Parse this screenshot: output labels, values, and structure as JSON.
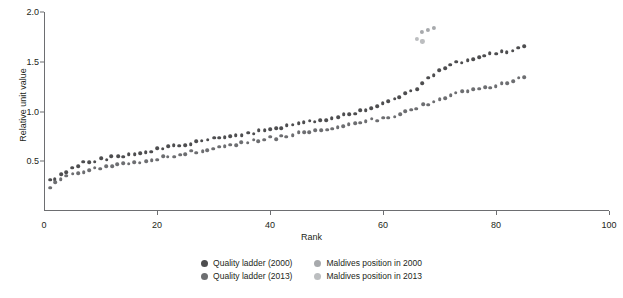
{
  "chart_data": {
    "type": "scatter",
    "title": "",
    "xlabel": "Rank",
    "ylabel": "Relative unit value",
    "xlim": [
      0,
      100
    ],
    "ylim": [
      0.0,
      2.0
    ],
    "xticks": [
      0,
      20,
      40,
      60,
      80,
      100
    ],
    "yticks": [
      0.5,
      1.0,
      1.5,
      2.0
    ],
    "ytick_labels": [
      "0.5",
      "1.0",
      "1.5",
      "2.0"
    ],
    "xtick_labels": [
      "0",
      "20",
      "40",
      "60",
      "80",
      "100"
    ],
    "grid": false,
    "legend_position": "bottom-center",
    "series": [
      {
        "name": "Quality ladder (2000)",
        "color": "#4d4d4f",
        "points": [
          [
            1,
            0.3
          ],
          [
            2,
            0.33
          ],
          [
            3,
            0.37
          ],
          [
            4,
            0.4
          ],
          [
            5,
            0.43
          ],
          [
            6,
            0.46
          ],
          [
            7,
            0.48
          ],
          [
            8,
            0.5
          ],
          [
            9,
            0.51
          ],
          [
            10,
            0.52
          ],
          [
            11,
            0.53
          ],
          [
            12,
            0.54
          ],
          [
            13,
            0.55
          ],
          [
            14,
            0.56
          ],
          [
            15,
            0.57
          ],
          [
            16,
            0.58
          ],
          [
            17,
            0.59
          ],
          [
            18,
            0.6
          ],
          [
            19,
            0.61
          ],
          [
            20,
            0.62
          ],
          [
            21,
            0.63
          ],
          [
            22,
            0.64
          ],
          [
            23,
            0.65
          ],
          [
            24,
            0.66
          ],
          [
            25,
            0.67
          ],
          [
            26,
            0.68
          ],
          [
            27,
            0.69
          ],
          [
            28,
            0.7
          ],
          [
            29,
            0.71
          ],
          [
            30,
            0.72
          ],
          [
            31,
            0.73
          ],
          [
            32,
            0.74
          ],
          [
            33,
            0.75
          ],
          [
            34,
            0.76
          ],
          [
            35,
            0.77
          ],
          [
            36,
            0.78
          ],
          [
            37,
            0.79
          ],
          [
            38,
            0.8
          ],
          [
            39,
            0.81
          ],
          [
            40,
            0.82
          ],
          [
            41,
            0.83
          ],
          [
            42,
            0.84
          ],
          [
            43,
            0.85
          ],
          [
            44,
            0.86
          ],
          [
            45,
            0.87
          ],
          [
            46,
            0.88
          ],
          [
            47,
            0.89
          ],
          [
            48,
            0.9
          ],
          [
            49,
            0.91
          ],
          [
            50,
            0.92
          ],
          [
            51,
            0.94
          ],
          [
            52,
            0.95
          ],
          [
            53,
            0.96
          ],
          [
            54,
            0.98
          ],
          [
            55,
            0.99
          ],
          [
            56,
            1.0
          ],
          [
            57,
            1.02
          ],
          [
            58,
            1.04
          ],
          [
            59,
            1.06
          ],
          [
            60,
            1.08
          ],
          [
            61,
            1.1
          ],
          [
            62,
            1.12
          ],
          [
            63,
            1.15
          ],
          [
            64,
            1.17
          ],
          [
            65,
            1.2
          ],
          [
            66,
            1.24
          ],
          [
            67,
            1.28
          ],
          [
            68,
            1.33
          ],
          [
            69,
            1.38
          ],
          [
            70,
            1.42
          ],
          [
            71,
            1.45
          ],
          [
            72,
            1.47
          ],
          [
            73,
            1.49
          ],
          [
            74,
            1.5
          ],
          [
            75,
            1.51
          ],
          [
            76,
            1.52
          ],
          [
            77,
            1.53
          ],
          [
            78,
            1.55
          ],
          [
            79,
            1.57
          ],
          [
            80,
            1.58
          ],
          [
            81,
            1.59
          ],
          [
            82,
            1.6
          ],
          [
            83,
            1.62
          ],
          [
            84,
            1.64
          ],
          [
            85,
            1.67
          ]
        ]
      },
      {
        "name": "Quality ladder (2013)",
        "color": "#6d6e71",
        "points": [
          [
            1,
            0.25
          ],
          [
            2,
            0.28
          ],
          [
            3,
            0.31
          ],
          [
            4,
            0.34
          ],
          [
            5,
            0.36
          ],
          [
            6,
            0.38
          ],
          [
            7,
            0.4
          ],
          [
            8,
            0.41
          ],
          [
            9,
            0.42
          ],
          [
            10,
            0.43
          ],
          [
            11,
            0.44
          ],
          [
            12,
            0.45
          ],
          [
            13,
            0.46
          ],
          [
            14,
            0.47
          ],
          [
            15,
            0.48
          ],
          [
            16,
            0.49
          ],
          [
            17,
            0.5
          ],
          [
            18,
            0.51
          ],
          [
            19,
            0.52
          ],
          [
            20,
            0.53
          ],
          [
            21,
            0.54
          ],
          [
            22,
            0.55
          ],
          [
            23,
            0.56
          ],
          [
            24,
            0.57
          ],
          [
            25,
            0.58
          ],
          [
            26,
            0.59
          ],
          [
            27,
            0.6
          ],
          [
            28,
            0.61
          ],
          [
            29,
            0.62
          ],
          [
            30,
            0.63
          ],
          [
            31,
            0.64
          ],
          [
            32,
            0.65
          ],
          [
            33,
            0.66
          ],
          [
            34,
            0.67
          ],
          [
            35,
            0.68
          ],
          [
            36,
            0.69
          ],
          [
            37,
            0.7
          ],
          [
            38,
            0.71
          ],
          [
            39,
            0.72
          ],
          [
            40,
            0.73
          ],
          [
            41,
            0.74
          ],
          [
            42,
            0.75
          ],
          [
            43,
            0.76
          ],
          [
            44,
            0.77
          ],
          [
            45,
            0.78
          ],
          [
            46,
            0.79
          ],
          [
            47,
            0.8
          ],
          [
            48,
            0.81
          ],
          [
            49,
            0.82
          ],
          [
            50,
            0.83
          ],
          [
            51,
            0.84
          ],
          [
            52,
            0.85
          ],
          [
            53,
            0.86
          ],
          [
            54,
            0.87
          ],
          [
            55,
            0.88
          ],
          [
            56,
            0.89
          ],
          [
            57,
            0.9
          ],
          [
            58,
            0.91
          ],
          [
            59,
            0.92
          ],
          [
            60,
            0.93
          ],
          [
            61,
            0.94
          ],
          [
            62,
            0.96
          ],
          [
            63,
            0.98
          ],
          [
            64,
            1.0
          ],
          [
            65,
            1.02
          ],
          [
            66,
            1.04
          ],
          [
            67,
            1.06
          ],
          [
            68,
            1.08
          ],
          [
            69,
            1.1
          ],
          [
            70,
            1.12
          ],
          [
            71,
            1.14
          ],
          [
            72,
            1.16
          ],
          [
            73,
            1.18
          ],
          [
            74,
            1.19
          ],
          [
            75,
            1.2
          ],
          [
            76,
            1.21
          ],
          [
            77,
            1.22
          ],
          [
            78,
            1.23
          ],
          [
            79,
            1.24
          ],
          [
            80,
            1.25
          ],
          [
            81,
            1.27
          ],
          [
            82,
            1.29
          ],
          [
            83,
            1.31
          ],
          [
            84,
            1.33
          ],
          [
            85,
            1.35
          ]
        ]
      },
      {
        "name": "Maldives position in 2000",
        "color": "#a7a9ac",
        "points": [
          [
            67,
            1.79
          ],
          [
            68,
            1.82
          ],
          [
            69,
            1.84
          ]
        ]
      },
      {
        "name": "Maldives position in 2013",
        "color": "#bcbec0",
        "points": [
          [
            66,
            1.74
          ],
          [
            67,
            1.72
          ]
        ]
      }
    ]
  },
  "axes": {
    "ylabel": "Relative unit value",
    "xlabel": "Rank"
  },
  "legend": {
    "items": [
      {
        "label": "Quality ladder (2000)",
        "color": "#4d4d4f"
      },
      {
        "label": "Maldives position in 2000",
        "color": "#a7a9ac"
      },
      {
        "label": "Quality ladder (2013)",
        "color": "#6d6e71"
      },
      {
        "label": "Maldives position in 2013",
        "color": "#bcbec0"
      }
    ]
  },
  "clipped_title": ""
}
